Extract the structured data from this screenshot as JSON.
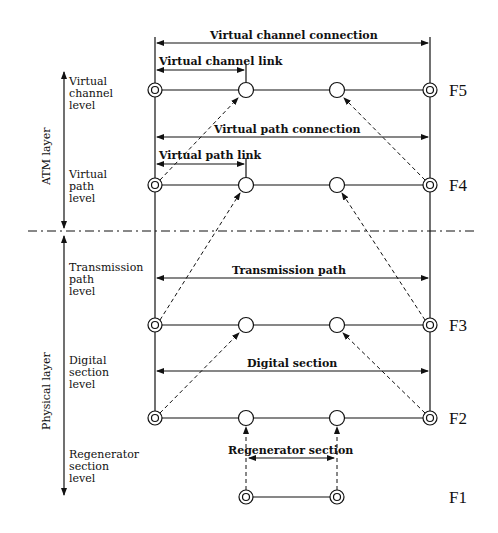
{
  "layers": {
    "atm": "ATM layer",
    "physical": "Physical layer"
  },
  "levels": {
    "virtual_channel": [
      "Virtual",
      "channel",
      "level"
    ],
    "virtual_path": [
      "Virtual",
      "path",
      "level"
    ],
    "transmission_path": [
      "Transmission",
      "path",
      "level"
    ],
    "digital_section": [
      "Digital",
      "section",
      "level"
    ],
    "regenerator_section": [
      "Regenerator",
      "section",
      "level"
    ]
  },
  "spans": {
    "virtual_channel_connection": "Virtual channel connection",
    "virtual_channel_link": "Virtual channel link",
    "virtual_path_connection": "Virtual path connection",
    "virtual_path_link": "Virtual path link",
    "transmission_path": "Transmission path",
    "digital_section": "Digital section",
    "regenerator_section": "Regenerator section"
  },
  "flows": {
    "f5": "F5",
    "f4": "F4",
    "f3": "F3",
    "f2": "F2",
    "f1": "F1"
  }
}
